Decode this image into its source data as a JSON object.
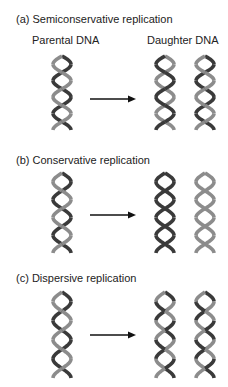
{
  "colors": {
    "dark_strand": "#3a3a3a",
    "light_strand": "#8c8c8c",
    "arrow": "#111111",
    "text": "#222222"
  },
  "panels": [
    {
      "id": "a",
      "title": "(a)  Semiconservative replication",
      "parent_label": "Parental DNA",
      "daughter_label": "Daughter DNA",
      "parent": {
        "strand1": "dark",
        "strand2": "light"
      },
      "daughters": [
        {
          "strand1": "light",
          "strand2": "dark"
        },
        {
          "strand1": "dark",
          "strand2": "light"
        }
      ]
    },
    {
      "id": "b",
      "title": "(b)  Conservative replication",
      "parent_label": "",
      "daughter_label": "",
      "parent": {
        "strand1": "dark",
        "strand2": "light"
      },
      "daughters": [
        {
          "strand1": "dark",
          "strand2": "dark"
        },
        {
          "strand1": "light",
          "strand2": "light"
        }
      ]
    },
    {
      "id": "c",
      "title": "(c)  Dispersive replication",
      "parent_label": "",
      "daughter_label": "",
      "parent": {
        "strand1": "dark",
        "strand2": "light"
      },
      "daughters": [
        {
          "strand1": "mixed",
          "strand2": "mixed"
        },
        {
          "strand1": "mixed",
          "strand2": "mixed"
        }
      ]
    }
  ]
}
